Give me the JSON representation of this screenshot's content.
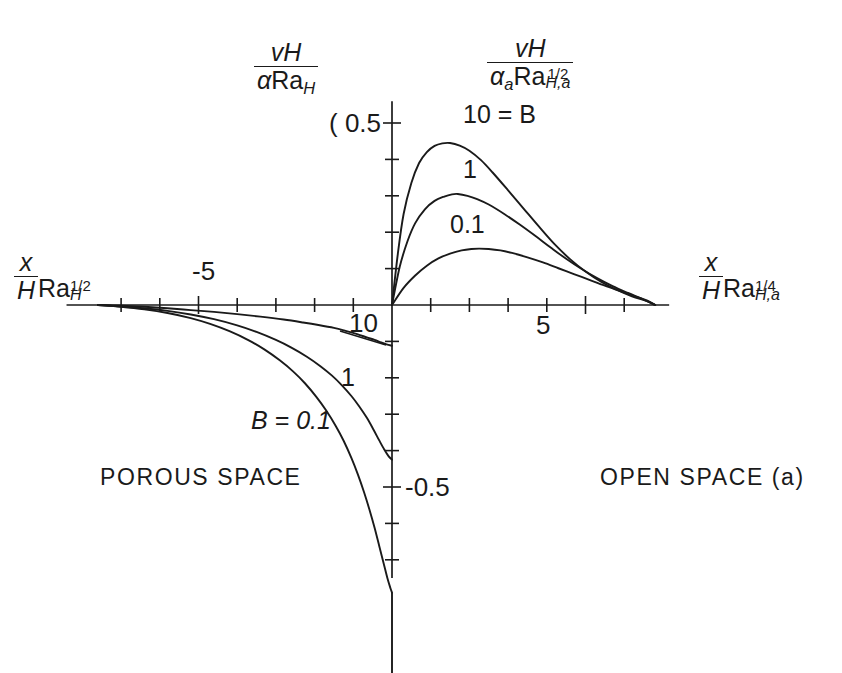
{
  "figure": {
    "background": "#ffffff",
    "line_color": "#1a1a1a",
    "axis_color": "#1a1a1a"
  },
  "axes": {
    "y_label_left": {
      "numerator": "vH",
      "denominator_alpha": "α",
      "denominator_ra": "Ra",
      "denominator_sub": "H"
    },
    "y_label_right": {
      "numerator": "vH",
      "denominator_alpha": "α",
      "denominator_alpha_sub": "a",
      "denominator_ra": "Ra",
      "denominator_sub": "H,a",
      "denominator_sup": "1/2"
    },
    "x_label_left": {
      "num": "x",
      "den": "H",
      "ra": "Ra",
      "sub": "H",
      "sup": "1/2"
    },
    "x_label_right": {
      "num": "x",
      "den": "H",
      "ra": "Ra",
      "sub": "H,a",
      "sup": "1/4"
    },
    "y_tick_positive": "0.5",
    "y_tick_positive_prefix": "(",
    "y_tick_negative": "-0.5",
    "x_tick_left": "-5",
    "x_tick_right": "5",
    "x_tick_origin_left": "10"
  },
  "curve_labels": {
    "top_b10": "10 = B",
    "top_b1": "1",
    "top_b01": "0.1",
    "bottom_b10": "10",
    "bottom_b1": "1",
    "bottom_b01": "B = 0.1"
  },
  "regions": {
    "left": "POROUS SPACE",
    "right": "OPEN SPACE (a)"
  },
  "chart_data": {
    "type": "line",
    "title": "",
    "xlabel_left": "(x/H) Ra_H^(1/2)",
    "xlabel_right": "(x/H) Ra_(H,a)^(1/4)",
    "ylabel_left": "vH / (alpha Ra_H)",
    "ylabel_right": "vH / (alpha_a Ra_(H,a)^(1/2))",
    "xlim": [
      -8.1,
      6.8
    ],
    "ylim": [
      -0.72,
      0.56
    ],
    "x_ticks": [
      -5,
      5
    ],
    "x_minor_ticks": [
      -7,
      -6,
      -5,
      -4,
      -3,
      -2,
      -1,
      1,
      2,
      3,
      4,
      5,
      6
    ],
    "y_ticks": [
      0.5,
      -0.5
    ],
    "y_minor_ticks": [
      0.1,
      0.2,
      0.3,
      0.4,
      0.5,
      -0.1,
      -0.2,
      -0.3,
      -0.4,
      -0.5,
      -0.6,
      -0.7
    ],
    "grid": false,
    "legend_position": "inline-curve-labels",
    "origin_note": "piecewise: left half is porous space scaling, right half is open space scaling",
    "series": [
      {
        "name": "B = 10",
        "label_top": "10 = B",
        "label_bottom": "10",
        "peak": {
          "x": 1.5,
          "y": 0.445
        },
        "value_at_origin_left": -0.11,
        "points_right": [
          [
            0.0,
            0.0
          ],
          [
            0.15,
            0.14
          ],
          [
            0.3,
            0.25
          ],
          [
            0.5,
            0.335
          ],
          [
            0.7,
            0.39
          ],
          [
            0.9,
            0.42
          ],
          [
            1.1,
            0.437
          ],
          [
            1.3,
            0.444
          ],
          [
            1.5,
            0.445
          ],
          [
            1.75,
            0.438
          ],
          [
            2.0,
            0.424
          ],
          [
            2.3,
            0.398
          ],
          [
            2.6,
            0.364
          ],
          [
            3.0,
            0.315
          ],
          [
            3.4,
            0.265
          ],
          [
            3.8,
            0.215
          ],
          [
            4.2,
            0.167
          ],
          [
            4.6,
            0.126
          ],
          [
            5.0,
            0.092
          ],
          [
            5.4,
            0.064
          ],
          [
            5.8,
            0.042
          ],
          [
            6.2,
            0.024
          ],
          [
            6.6,
            0.01
          ],
          [
            6.8,
            0.0
          ]
        ],
        "points_left": [
          [
            -7.6,
            0.0
          ],
          [
            -7.0,
            -0.002
          ],
          [
            -6.4,
            -0.005
          ],
          [
            -5.8,
            -0.009
          ],
          [
            -5.2,
            -0.014
          ],
          [
            -4.6,
            -0.019
          ],
          [
            -4.0,
            -0.025
          ],
          [
            -3.4,
            -0.032
          ],
          [
            -2.8,
            -0.04
          ],
          [
            -2.3,
            -0.048
          ],
          [
            -1.9,
            -0.055
          ],
          [
            -1.5,
            -0.063
          ],
          [
            -1.2,
            -0.071
          ],
          [
            -0.9,
            -0.08
          ],
          [
            -0.65,
            -0.089
          ],
          [
            -0.45,
            -0.096
          ],
          [
            -0.28,
            -0.103
          ],
          [
            -0.14,
            -0.108
          ],
          [
            0.0,
            -0.112
          ]
        ]
      },
      {
        "name": "B = 1",
        "label_top": "1",
        "label_bottom": "1",
        "peak": {
          "x": 1.7,
          "y": 0.305
        },
        "value_at_origin_left": -0.425,
        "points_right": [
          [
            0.0,
            0.0
          ],
          [
            0.2,
            0.105
          ],
          [
            0.4,
            0.175
          ],
          [
            0.6,
            0.225
          ],
          [
            0.85,
            0.263
          ],
          [
            1.1,
            0.286
          ],
          [
            1.35,
            0.298
          ],
          [
            1.55,
            0.304
          ],
          [
            1.7,
            0.305
          ],
          [
            1.95,
            0.3
          ],
          [
            2.2,
            0.291
          ],
          [
            2.5,
            0.276
          ],
          [
            2.9,
            0.25
          ],
          [
            3.3,
            0.221
          ],
          [
            3.7,
            0.19
          ],
          [
            4.1,
            0.158
          ],
          [
            4.5,
            0.127
          ],
          [
            4.9,
            0.099
          ],
          [
            5.3,
            0.074
          ],
          [
            5.7,
            0.052
          ],
          [
            6.1,
            0.033
          ],
          [
            6.5,
            0.015
          ],
          [
            6.8,
            0.0
          ]
        ],
        "points_left": [
          [
            -7.6,
            0.0
          ],
          [
            -7.0,
            -0.004
          ],
          [
            -6.4,
            -0.009
          ],
          [
            -5.8,
            -0.016
          ],
          [
            -5.2,
            -0.026
          ],
          [
            -4.6,
            -0.039
          ],
          [
            -4.0,
            -0.056
          ],
          [
            -3.5,
            -0.074
          ],
          [
            -3.0,
            -0.096
          ],
          [
            -2.6,
            -0.117
          ],
          [
            -2.2,
            -0.142
          ],
          [
            -1.85,
            -0.168
          ],
          [
            -1.55,
            -0.194
          ],
          [
            -1.3,
            -0.22
          ],
          [
            -1.05,
            -0.25
          ],
          [
            -0.85,
            -0.278
          ],
          [
            -0.65,
            -0.31
          ],
          [
            -0.48,
            -0.342
          ],
          [
            -0.33,
            -0.372
          ],
          [
            -0.2,
            -0.397
          ],
          [
            -0.09,
            -0.415
          ],
          [
            0.0,
            -0.425
          ]
        ]
      },
      {
        "name": "B = 0.1",
        "label_top": "0.1",
        "label_bottom": "B = 0.1",
        "peak": {
          "x": 2.25,
          "y": 0.155
        },
        "value_at_origin_left": -0.78,
        "points_right": [
          [
            0.0,
            0.0
          ],
          [
            0.3,
            0.047
          ],
          [
            0.6,
            0.081
          ],
          [
            0.9,
            0.108
          ],
          [
            1.2,
            0.128
          ],
          [
            1.5,
            0.141
          ],
          [
            1.8,
            0.15
          ],
          [
            2.05,
            0.154
          ],
          [
            2.25,
            0.155
          ],
          [
            2.5,
            0.154
          ],
          [
            2.8,
            0.15
          ],
          [
            3.1,
            0.143
          ],
          [
            3.5,
            0.131
          ],
          [
            3.9,
            0.117
          ],
          [
            4.3,
            0.101
          ],
          [
            4.7,
            0.085
          ],
          [
            5.1,
            0.069
          ],
          [
            5.5,
            0.053
          ],
          [
            5.9,
            0.038
          ],
          [
            6.3,
            0.023
          ],
          [
            6.6,
            0.012
          ],
          [
            6.8,
            0.0
          ]
        ],
        "points_left": [
          [
            -7.6,
            0.0
          ],
          [
            -7.0,
            -0.005
          ],
          [
            -6.4,
            -0.012
          ],
          [
            -5.8,
            -0.022
          ],
          [
            -5.2,
            -0.036
          ],
          [
            -4.7,
            -0.052
          ],
          [
            -4.2,
            -0.072
          ],
          [
            -3.7,
            -0.097
          ],
          [
            -3.3,
            -0.122
          ],
          [
            -2.9,
            -0.152
          ],
          [
            -2.55,
            -0.183
          ],
          [
            -2.25,
            -0.215
          ],
          [
            -1.95,
            -0.253
          ],
          [
            -1.7,
            -0.29
          ],
          [
            -1.45,
            -0.333
          ],
          [
            -1.25,
            -0.373
          ],
          [
            -1.05,
            -0.42
          ],
          [
            -0.88,
            -0.466
          ],
          [
            -0.72,
            -0.515
          ],
          [
            -0.58,
            -0.563
          ],
          [
            -0.45,
            -0.612
          ],
          [
            -0.33,
            -0.662
          ],
          [
            -0.22,
            -0.708
          ],
          [
            -0.12,
            -0.75
          ],
          [
            -0.04,
            -0.778
          ],
          [
            0.0,
            -0.79
          ]
        ]
      }
    ]
  }
}
